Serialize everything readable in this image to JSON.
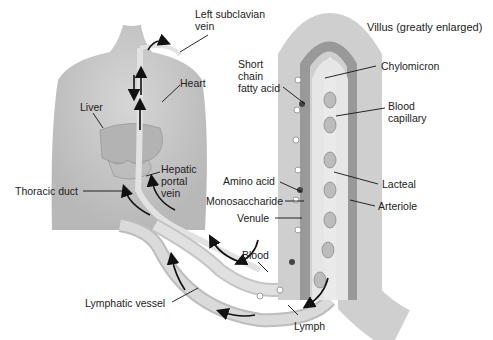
{
  "diagram": {
    "title": "Villus (greatly enlarged)",
    "labels": {
      "left_subclavian_vein": "Left subclavian vein",
      "left_subclavian_line1": "Left subclavian",
      "left_subclavian_line2": "vein",
      "heart": "Heart",
      "liver": "Liver",
      "short_chain_line1": "Short",
      "short_chain_line2": "chain",
      "short_chain_line3": "fatty acid",
      "chylomicron": "Chylomicron",
      "blood_capillary_line1": "Blood",
      "blood_capillary_line2": "capillary",
      "hepatic_line1": "Hepatic",
      "hepatic_line2": "portal",
      "hepatic_line3": "vein",
      "thoracic_duct": "Thoracic duct",
      "amino_acid": "Amino acid",
      "monosaccharide": "Monosaccharide",
      "venule": "Venule",
      "lacteal": "Lacteal",
      "arteriole": "Arteriole",
      "blood": "Blood",
      "lymphatic_vessel": "Lymphatic vessel",
      "lymph": "Lymph"
    },
    "colors": {
      "body": "#c9c9c9",
      "vessel": "#dcdcdc",
      "villus_outer": "#cfcfcf",
      "capillary": "#8a8a8a",
      "arrow": "#111111",
      "text": "#222222"
    }
  }
}
